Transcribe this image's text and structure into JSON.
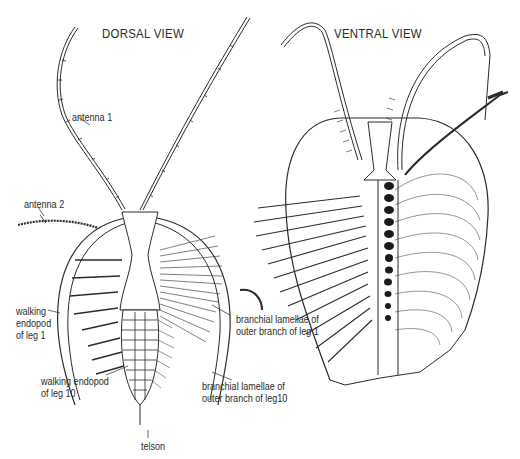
{
  "figure": {
    "views": [
      {
        "id": "dorsal",
        "title": "DORSAL VIEW"
      },
      {
        "id": "ventral",
        "title": "VENTRAL VIEW"
      }
    ],
    "labels": {
      "antenna1": "antenna 1",
      "antenna2": "antenna 2",
      "walking_endopod_leg1": "walking\nendopod\nof leg 1",
      "walking_endopod_leg10": "walking endopod\nof leg 10",
      "branchial_leg1": "branchial lamellae of\nouter branch of leg 1",
      "branchial_leg10": "branchial lamellae of\nouter branch of leg10",
      "telson": "telson"
    },
    "colors": {
      "ink": "#2a2a2a",
      "background": "#ffffff"
    }
  }
}
